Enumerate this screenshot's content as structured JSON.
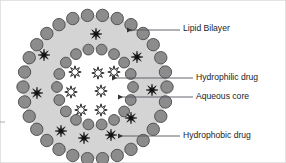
{
  "figure": {
    "canvas": {
      "width": 286,
      "height": 163,
      "background": "#ffffff"
    },
    "colors": {
      "lipid_head": "#8c8c8c",
      "lipid_head_stroke": "#4a4a4a",
      "shell_fill": "#d4d4d4",
      "core_fill": "#ffffff",
      "hydrophobic_star": "#111111",
      "hydrophilic_star_fill": "#ffffff",
      "hydrophilic_star_stroke": "#2b2b2b",
      "leader_line": "#55555f",
      "text": "#1c1c1c",
      "frame_border": "#cfcfcf"
    },
    "vesicle": {
      "center_x": 95,
      "center_y": 87,
      "outer_ring_radius": 72,
      "outer_ring_bead_count": 30,
      "outer_ring_bead_radius": 6.2,
      "inner_ring_radius": 38,
      "inner_ring_bead_count": 18,
      "inner_ring_bead_radius": 5.4
    },
    "hydrophilic_drug_positions": [
      {
        "x": 75,
        "y": 72
      },
      {
        "x": 98,
        "y": 73
      },
      {
        "x": 114,
        "y": 72
      },
      {
        "x": 71,
        "y": 92
      },
      {
        "x": 101,
        "y": 91
      },
      {
        "x": 81,
        "y": 110
      },
      {
        "x": 101,
        "y": 110
      }
    ],
    "hydrophobic_drug_positions": [
      {
        "x": 96,
        "y": 34
      },
      {
        "x": 44,
        "y": 55
      },
      {
        "x": 137,
        "y": 57
      },
      {
        "x": 37,
        "y": 93
      },
      {
        "x": 152,
        "y": 90
      },
      {
        "x": 131,
        "y": 118
      },
      {
        "x": 61,
        "y": 131
      },
      {
        "x": 84,
        "y": 138
      },
      {
        "x": 111,
        "y": 135
      }
    ],
    "labels": [
      {
        "id": "lipid-bilayer",
        "text": "Lipid Bilayer",
        "text_x": 183,
        "text_y": 29,
        "line_x1": 180,
        "line_x2": 127,
        "line_y": 30,
        "arrow_x": 124,
        "arrow_y": 30
      },
      {
        "id": "hydrophilic-drug",
        "text": "Hydrophilic drug",
        "text_x": 196,
        "text_y": 78,
        "line_x1": 193,
        "line_x2": 112,
        "line_y": 78,
        "arrow_x": 109,
        "arrow_y": 78
      },
      {
        "id": "aqueous-core",
        "text": "Aqueous core",
        "text_x": 196,
        "text_y": 97,
        "line_x1": 193,
        "line_x2": 118,
        "line_y": 97,
        "arrow_x": 115,
        "arrow_y": 97
      },
      {
        "id": "hydrophobic-drug",
        "text": "Hydrophobic drug",
        "text_x": 183,
        "text_y": 136,
        "line_x1": 180,
        "line_x2": 118,
        "line_y": 136,
        "arrow_x": 115,
        "arrow_y": 136
      }
    ]
  }
}
